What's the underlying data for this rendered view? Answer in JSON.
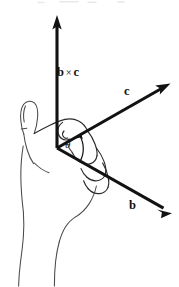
{
  "figure": {
    "background_color": "#ffffff",
    "vector_color": "#121212",
    "hand_outline_color": "#4a4a4a",
    "width": 179,
    "height": 287,
    "labels": {
      "cross_product": {
        "operand_left": "b",
        "operator": "×",
        "operand_right": "c"
      },
      "vector_c": "c",
      "vector_b": "b",
      "angle": "θ"
    },
    "origin": {
      "x": 57,
      "y": 148
    },
    "vectors": [
      {
        "name": "b-cross-c",
        "label": "b × c",
        "tip_x": 57,
        "tip_y": 16,
        "direction": "up"
      },
      {
        "name": "c",
        "label": "c",
        "tip_x": 170,
        "tip_y": 82,
        "direction": "upper-right"
      },
      {
        "name": "b",
        "label": "b",
        "tip_x": 172,
        "tip_y": 214,
        "direction": "lower-right"
      }
    ],
    "angle_arc": {
      "label": "θ",
      "from_vector": "b",
      "to_vector": "c",
      "center_x": 57,
      "center_y": 148
    }
  }
}
